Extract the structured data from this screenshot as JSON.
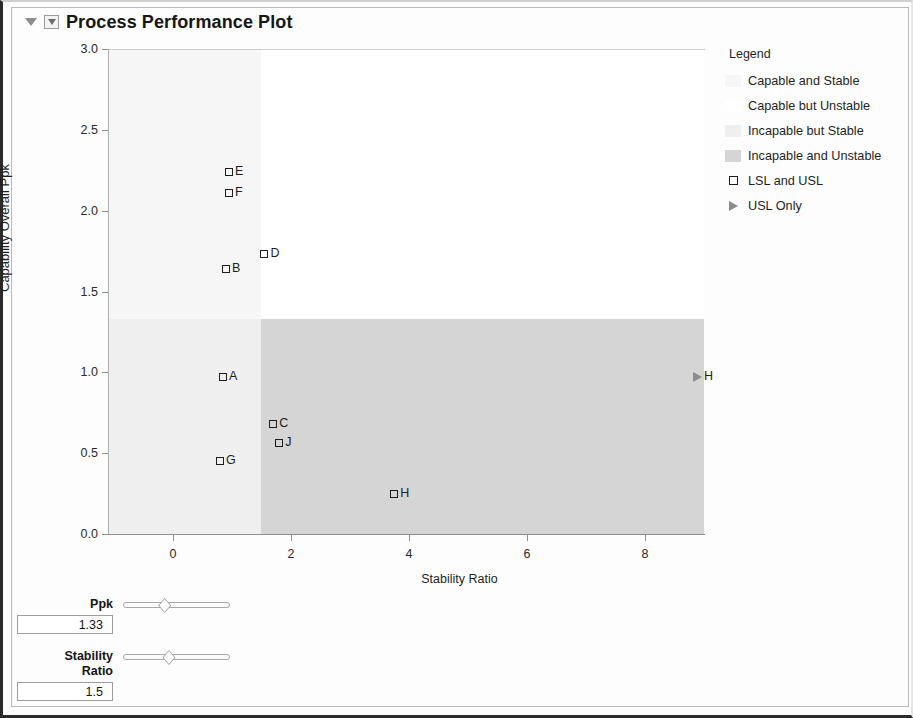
{
  "window": {
    "title": "Process Performance Plot",
    "collapse_icon": "triangle-down-icon",
    "menu_icon": "triangle-down-box-icon"
  },
  "legend": {
    "title": "Legend",
    "entries": [
      {
        "label": "Capable and Stable",
        "swatch": "#f6f6f6",
        "marker": "swatch"
      },
      {
        "label": "Capable but Unstable",
        "swatch": "#ffffff",
        "marker": "swatch"
      },
      {
        "label": "Incapable but Stable",
        "swatch": "#efefef",
        "marker": "swatch"
      },
      {
        "label": "Incapable and Unstable",
        "swatch": "#d5d5d5",
        "marker": "swatch"
      },
      {
        "label": "LSL and USL",
        "swatch": "",
        "marker": "square"
      },
      {
        "label": "USL Only",
        "swatch": "",
        "marker": "triangle"
      }
    ]
  },
  "controls": [
    {
      "name": "Ppk",
      "label": "Ppk",
      "value": "1.33",
      "slider_pos_pct": 39
    },
    {
      "name": "Stability Ratio",
      "label": "Stability\nRatio",
      "value": "1.5",
      "slider_pos_pct": 43
    }
  ],
  "chart_data": {
    "type": "scatter",
    "title": "Process Performance Plot",
    "xlabel": "Stability Ratio",
    "ylabel": "Capability Overall Ppk",
    "xlim": [
      -1.1,
      9.0
    ],
    "ylim": [
      0.0,
      3.0
    ],
    "xticks": [
      0,
      2,
      4,
      6,
      8
    ],
    "yticks": [
      0.0,
      0.5,
      1.0,
      1.5,
      2.0,
      2.5,
      3.0
    ],
    "ytick_labels": [
      "0.0",
      "0.5",
      "1.0",
      "1.5",
      "2.0",
      "2.5",
      "3.0"
    ],
    "xtick_labels": [
      "0",
      "2",
      "4",
      "6",
      "8"
    ],
    "grid": false,
    "legend_position": "right",
    "reference_lines": {
      "ppk_threshold": 1.33,
      "stability_ratio_threshold": 1.5
    },
    "regions": [
      {
        "name": "Capable and Stable",
        "x_range": [
          -1.1,
          1.5
        ],
        "y_range": [
          1.33,
          3.0
        ],
        "color": "#f6f6f6"
      },
      {
        "name": "Capable but Unstable",
        "x_range": [
          1.5,
          9.0
        ],
        "y_range": [
          1.33,
          3.0
        ],
        "color": "#ffffff"
      },
      {
        "name": "Incapable but Stable",
        "x_range": [
          -1.1,
          1.5
        ],
        "y_range": [
          0.0,
          1.33
        ],
        "color": "#efefef"
      },
      {
        "name": "Incapable and Unstable",
        "x_range": [
          1.5,
          9.0
        ],
        "y_range": [
          0.0,
          1.33
        ],
        "color": "#d5d5d5"
      }
    ],
    "points": [
      {
        "label": "E",
        "x": 0.95,
        "y": 2.24,
        "marker": "square"
      },
      {
        "label": "F",
        "x": 0.95,
        "y": 2.11,
        "marker": "square"
      },
      {
        "label": "D",
        "x": 1.55,
        "y": 1.73,
        "marker": "square"
      },
      {
        "label": "B",
        "x": 0.9,
        "y": 1.64,
        "marker": "square"
      },
      {
        "label": "A",
        "x": 0.85,
        "y": 0.97,
        "marker": "square"
      },
      {
        "label": "C",
        "x": 1.7,
        "y": 0.68,
        "marker": "square"
      },
      {
        "label": "J",
        "x": 1.8,
        "y": 0.56,
        "marker": "square"
      },
      {
        "label": "G",
        "x": 0.8,
        "y": 0.45,
        "marker": "square"
      },
      {
        "label": "H",
        "x": 3.75,
        "y": 0.25,
        "marker": "square"
      },
      {
        "label": "H",
        "x": 8.9,
        "y": 0.97,
        "marker": "triangle"
      }
    ]
  }
}
